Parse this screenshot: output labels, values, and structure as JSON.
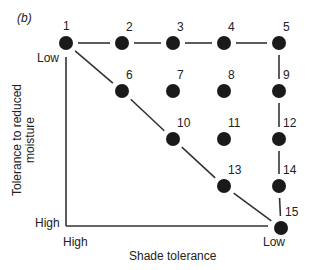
{
  "figure": {
    "panel_label": "(b)",
    "y_axis": {
      "label_line1": "Tolerance to reduced",
      "label_line2": "moisture",
      "top_label": "Low",
      "bottom_label": "High"
    },
    "x_axis": {
      "label": "Shade tolerance",
      "left_label": "High",
      "right_label": "Low"
    },
    "nodes": [
      {
        "id": "1",
        "x": 66,
        "y": 43
      },
      {
        "id": "2",
        "x": 122,
        "y": 43
      },
      {
        "id": "3",
        "x": 173,
        "y": 43
      },
      {
        "id": "4",
        "x": 224,
        "y": 43
      },
      {
        "id": "5",
        "x": 279,
        "y": 43
      },
      {
        "id": "6",
        "x": 122,
        "y": 91
      },
      {
        "id": "7",
        "x": 173,
        "y": 91
      },
      {
        "id": "8",
        "x": 224,
        "y": 91
      },
      {
        "id": "9",
        "x": 279,
        "y": 91
      },
      {
        "id": "10",
        "x": 173,
        "y": 139
      },
      {
        "id": "11",
        "x": 224,
        "y": 139
      },
      {
        "id": "12",
        "x": 279,
        "y": 139
      },
      {
        "id": "13",
        "x": 224,
        "y": 186
      },
      {
        "id": "14",
        "x": 279,
        "y": 186
      },
      {
        "id": "15",
        "x": 281,
        "y": 228
      }
    ],
    "edges": [
      [
        "1",
        "2"
      ],
      [
        "2",
        "3"
      ],
      [
        "3",
        "4"
      ],
      [
        "4",
        "5"
      ],
      [
        "5",
        "9"
      ],
      [
        "9",
        "12"
      ],
      [
        "12",
        "14"
      ],
      [
        "14",
        "15"
      ],
      [
        "1",
        "6"
      ],
      [
        "6",
        "10"
      ],
      [
        "10",
        "13"
      ],
      [
        "13",
        "15"
      ]
    ],
    "colors": {
      "ink": "#1a1a1a",
      "background": "#ffffff"
    }
  }
}
